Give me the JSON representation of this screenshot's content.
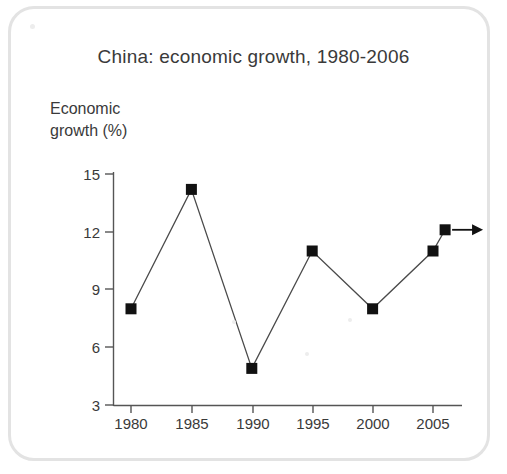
{
  "figure": {
    "title": "China: economic growth, 1980-2006",
    "frame_color": "#e3e3e3",
    "background": "#ffffff"
  },
  "chart_data": {
    "type": "line",
    "title": "China: economic growth, 1980-2006",
    "xlabel": "",
    "ylabel": "Economic growth (%)",
    "ylabel_lines": "Economic\ngrowth (%)",
    "x": [
      1980,
      1985,
      1990,
      1995,
      2000,
      2005,
      2006
    ],
    "values": [
      8.0,
      14.2,
      4.9,
      11.0,
      8.0,
      11.0,
      12.1
    ],
    "categories": [
      "1980",
      "1985",
      "1990",
      "1995",
      "2000",
      "2005",
      "2006"
    ],
    "xtick_labels": [
      "1980",
      "1985",
      "1990",
      "1995",
      "2000",
      "2005"
    ],
    "xtick_values": [
      1980,
      1985,
      1990,
      1995,
      2000,
      2005
    ],
    "ytick_labels": [
      "15",
      "12",
      "9",
      "6",
      "3"
    ],
    "ytick_values": [
      15,
      12,
      9,
      6,
      3
    ],
    "ylim": [
      3,
      15
    ],
    "xlim": [
      1978.5,
      2007.5
    ],
    "grid": false,
    "legend": false,
    "marker": "square",
    "marker_color": "#111111",
    "line_color": "#4a4a4a",
    "annotation": "projection arrow extending right from final 2006 point"
  },
  "axis": {
    "y_label_15": "15",
    "y_label_12": "12",
    "y_label_9": "9",
    "y_label_6": "6",
    "y_label_3": "3",
    "x_label_1980": "1980",
    "x_label_1985": "1985",
    "x_label_1990": "1990",
    "x_label_1995": "1995",
    "x_label_2000": "2000",
    "x_label_2005": "2005"
  }
}
